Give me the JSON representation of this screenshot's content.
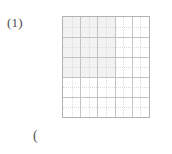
{
  "page": {
    "background_color": "#ffffff",
    "width": 172,
    "height": 154
  },
  "problem": {
    "number_label": "(1)"
  },
  "trailing": {
    "text": "("
  },
  "figure": {
    "name": "grid-figure",
    "type": "square-grid",
    "columns": 5,
    "rows": 5,
    "border_color": "#b2b2b2",
    "major_line_color": "#c4c4c4",
    "minor_line_color": "#dcdcdc",
    "shaded_fill_color": "#f2f2f2",
    "shaded_region": {
      "start_column": 1,
      "start_row": 1,
      "columns_spanned": 3,
      "rows_spanned": 3
    },
    "minor_divisions_per_cell": 2
  }
}
